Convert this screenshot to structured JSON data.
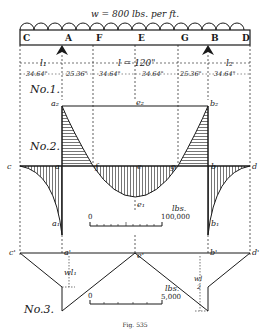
{
  "title": "w = 800 lbs. per ft.",
  "beam_points": [
    "C",
    "A",
    "F",
    "E",
    "G",
    "B",
    "D"
  ],
  "spans": {
    "l1": "l₁",
    "l": "l = 120\"",
    "l2": "l₂"
  },
  "segments": [
    "34.64\"",
    "25.36\"",
    "34.64\"",
    "34.64\"",
    "25.36\"",
    "34.64\""
  ],
  "diagram_labels": {
    "no1": "No.1.",
    "no2": "No.2.",
    "no3": "No.3."
  },
  "points_no1": {
    "a2": "a₂",
    "e2": "e₂",
    "b2": "b₂"
  },
  "points_no2": {
    "c": "c",
    "a": "a",
    "f": "f",
    "e": "e",
    "g": "g",
    "b": "b",
    "d": "d",
    "a1": "a₁",
    "e1": "e₁",
    "b1": "b₁"
  },
  "points_no3": {
    "c": "c'",
    "a": "a'",
    "e": "e'",
    "b": "b'",
    "d": "d'",
    "wl1": "wl₁",
    "wl2_num": "wl",
    "wl2_den": "2"
  },
  "scale_moment": {
    "zero": "0",
    "unit": "lbs.",
    "max": "100,000"
  },
  "scale_shear": {
    "zero": "0",
    "unit": "lbs.",
    "max": "5,000"
  },
  "caption": "Fig. 535"
}
